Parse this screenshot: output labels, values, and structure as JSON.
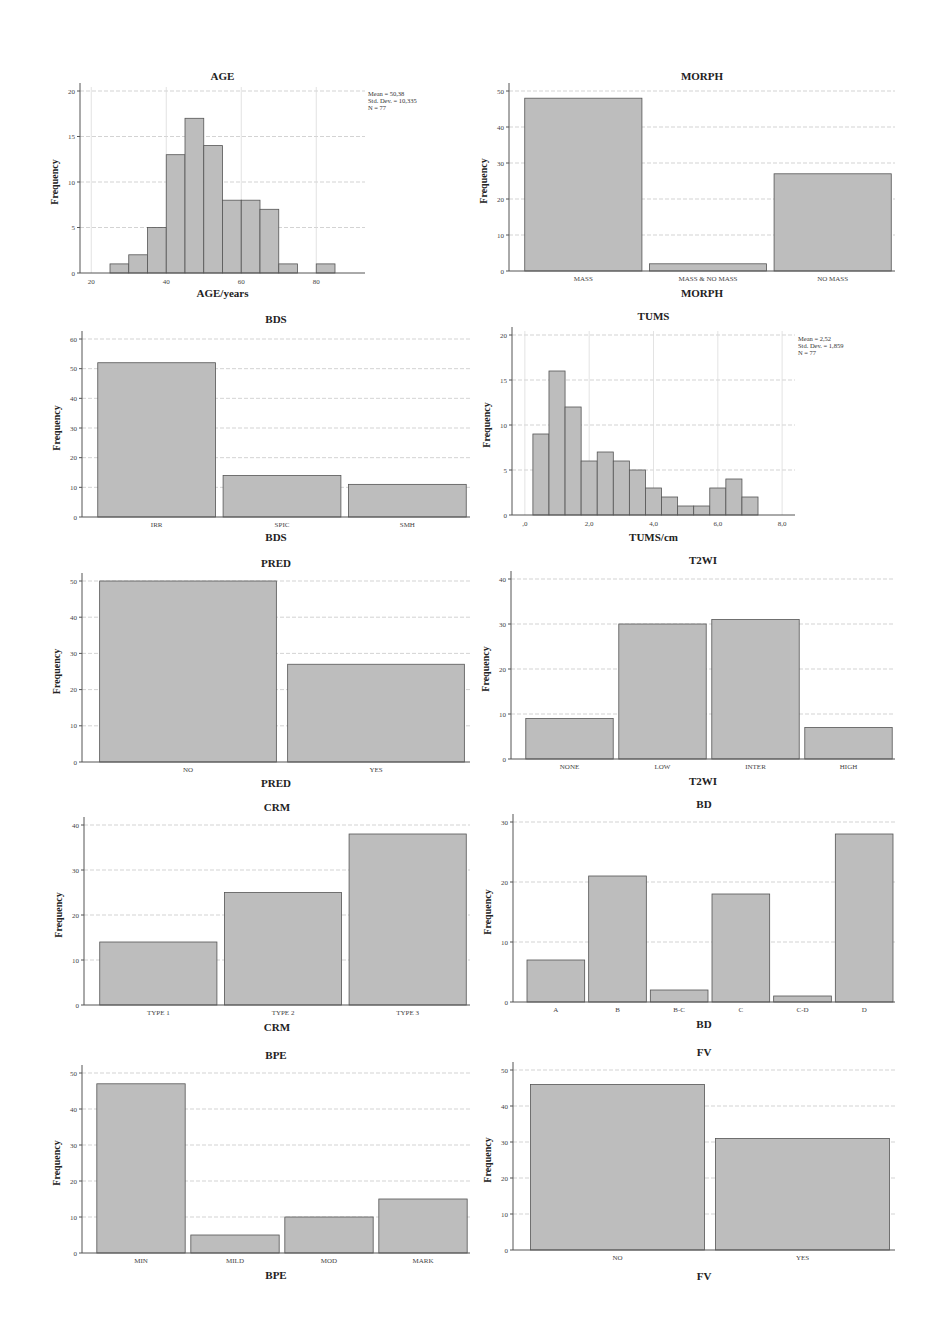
{
  "figure": {
    "width": 946,
    "height": 1341,
    "bar_color": "#bdbdbd",
    "bar_edge_color": "#555555",
    "grid_color": "#c8c8c8"
  },
  "chart_data": [
    {
      "id": "age",
      "type": "bar",
      "subtype": "histogram",
      "title": "AGE",
      "xlabel": "AGE/years",
      "ylabel": "Frequency",
      "ylim": [
        0,
        20
      ],
      "yticks": [
        0,
        5,
        10,
        15,
        20
      ],
      "xlim": [
        17,
        93
      ],
      "xticks": [
        20,
        40,
        60,
        80
      ],
      "xtick_labels": [
        "20",
        "40",
        "60",
        "80"
      ],
      "bin_start": 25,
      "bin_width": 5,
      "values": [
        1,
        2,
        5,
        13,
        17,
        14,
        8,
        8,
        7,
        1,
        0,
        1
      ],
      "stats": [
        "Mean = 50,38",
        "Std. Dev. = 10,335",
        "N = 77"
      ],
      "grid": true,
      "layout": {
        "left": 80,
        "top": 91,
        "bottom": 273,
        "right": 365,
        "title_y": 80,
        "xlabel_y": 297,
        "stats_x": 368,
        "stats_y": 96
      }
    },
    {
      "id": "morph",
      "type": "bar",
      "title": "MORPH",
      "xlabel": "MORPH",
      "ylabel": "Frequency",
      "ylim": [
        0,
        50
      ],
      "yticks": [
        0,
        10,
        20,
        30,
        40,
        50
      ],
      "categories": [
        "MASS",
        "MASS & NO MASS",
        "NO MASS"
      ],
      "values": [
        48,
        2,
        27
      ],
      "grid": true,
      "layout": {
        "left": 509,
        "top": 91,
        "bottom": 271,
        "right": 895,
        "title_y": 80,
        "xlabel_y": 297
      }
    },
    {
      "id": "bds",
      "type": "bar",
      "title": "BDS",
      "xlabel": "BDS",
      "ylabel": "Frequency",
      "ylim": [
        0,
        60
      ],
      "yticks": [
        0,
        10,
        20,
        30,
        40,
        50,
        60
      ],
      "categories": [
        "IRR",
        "SPIC",
        "SMH"
      ],
      "values": [
        52,
        14,
        11
      ],
      "grid": true,
      "layout": {
        "left": 82,
        "top": 339,
        "bottom": 517,
        "right": 470,
        "title_y": 323,
        "xlabel_y": 541
      }
    },
    {
      "id": "tums",
      "type": "bar",
      "subtype": "histogram",
      "title": "TUMS",
      "xlabel": "TUMS/cm",
      "ylabel": "Frequency",
      "ylim": [
        0,
        20
      ],
      "yticks": [
        0,
        5,
        10,
        15,
        20
      ],
      "xlim": [
        -0.4,
        8.4
      ],
      "xticks": [
        0,
        2,
        4,
        6,
        8
      ],
      "xtick_labels": [
        ",0",
        "2,0",
        "4,0",
        "6,0",
        "8,0"
      ],
      "bin_start": 0.25,
      "bin_width": 0.5,
      "values": [
        9,
        16,
        12,
        6,
        7,
        6,
        5,
        3,
        2,
        1,
        1,
        3,
        4,
        2
      ],
      "stats": [
        "Mean = 2,52",
        "Std. Dev. = 1,859",
        "N = 77"
      ],
      "grid": true,
      "layout": {
        "left": 512,
        "top": 335,
        "bottom": 515,
        "right": 795,
        "title_y": 320,
        "xlabel_y": 541,
        "stats_x": 798,
        "stats_y": 341
      }
    },
    {
      "id": "pred",
      "type": "bar",
      "title": "PRED",
      "xlabel": "PRED",
      "ylabel": "Frequency",
      "ylim": [
        0,
        50
      ],
      "yticks": [
        0,
        10,
        20,
        30,
        40,
        50
      ],
      "categories": [
        "NO",
        "YES"
      ],
      "values": [
        50,
        27
      ],
      "grid": true,
      "layout": {
        "left": 82,
        "top": 581,
        "bottom": 762,
        "right": 470,
        "title_y": 567,
        "xlabel_y": 787
      }
    },
    {
      "id": "t2wi",
      "type": "bar",
      "title": "T2WI",
      "xlabel": "T2WI",
      "ylabel": "Frequency",
      "ylim": [
        0,
        40
      ],
      "yticks": [
        0,
        10,
        20,
        30,
        40
      ],
      "categories": [
        "NONE",
        "LOW",
        "INTER",
        "HIGH"
      ],
      "values": [
        9,
        30,
        31,
        7
      ],
      "grid": true,
      "layout": {
        "left": 511,
        "top": 579,
        "bottom": 759,
        "right": 895,
        "title_y": 564,
        "xlabel_y": 785
      }
    },
    {
      "id": "crm",
      "type": "bar",
      "title": "CRM",
      "xlabel": "CRM",
      "ylabel": "Frequency",
      "ylim": [
        0,
        40
      ],
      "yticks": [
        0,
        10,
        20,
        30,
        40
      ],
      "categories": [
        "TYPE 1",
        "TYPE 2",
        "TYPE 3"
      ],
      "values": [
        14,
        25,
        38
      ],
      "grid": true,
      "layout": {
        "left": 84,
        "top": 825,
        "bottom": 1005,
        "right": 470,
        "title_y": 811,
        "xlabel_y": 1031
      }
    },
    {
      "id": "bd",
      "type": "bar",
      "title": "BD",
      "xlabel": "BD",
      "ylabel": "Frequency",
      "ylim": [
        0,
        30
      ],
      "yticks": [
        0,
        10,
        20,
        30
      ],
      "categories": [
        "A",
        "B",
        "B-C",
        "C",
        "C-D",
        "D"
      ],
      "values": [
        7,
        21,
        2,
        18,
        1,
        28
      ],
      "grid": true,
      "layout": {
        "left": 513,
        "top": 822,
        "bottom": 1002,
        "right": 895,
        "title_y": 808,
        "xlabel_y": 1028
      }
    },
    {
      "id": "bpe",
      "type": "bar",
      "title": "BPE",
      "xlabel": "BPE",
      "ylabel": "Frequency",
      "ylim": [
        0,
        50
      ],
      "yticks": [
        0,
        10,
        20,
        30,
        40,
        50
      ],
      "categories": [
        "MIN",
        "MILD",
        "MOD",
        "MARK"
      ],
      "values": [
        47,
        5,
        10,
        15
      ],
      "grid": true,
      "layout": {
        "left": 82,
        "top": 1073,
        "bottom": 1253,
        "right": 470,
        "title_y": 1059,
        "xlabel_y": 1279
      }
    },
    {
      "id": "fv",
      "type": "bar",
      "title": "FV",
      "xlabel": "FV",
      "ylabel": "Frequency",
      "ylim": [
        0,
        50
      ],
      "yticks": [
        0,
        10,
        20,
        30,
        40,
        50
      ],
      "categories": [
        "NO",
        "YES"
      ],
      "values": [
        46,
        31
      ],
      "grid": true,
      "layout": {
        "left": 513,
        "top": 1070,
        "bottom": 1250,
        "right": 895,
        "title_y": 1056,
        "xlabel_y": 1280
      }
    }
  ]
}
